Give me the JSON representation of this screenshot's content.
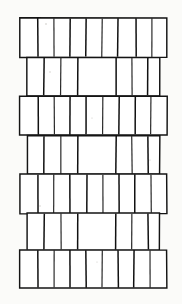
{
  "figure": {
    "medium": "black ink line drawing on off-white paper",
    "width_px": 182,
    "height_px": 304,
    "colors": {
      "ink": "#141414",
      "paper": "#fbfbf9",
      "brick_face": "#ffffff",
      "speck": "#c9c7c2"
    },
    "geometry": {
      "course_count": 7,
      "full_course_indices": [
        0,
        2,
        4,
        6
      ],
      "gap_course_indices": [
        1,
        3,
        5
      ],
      "wide_course_left_x": 20,
      "wide_course_right_x": 167,
      "narrow_course_left_x": 27,
      "narrow_course_right_x": 160,
      "course_tops": [
        18,
        57,
        96,
        135,
        174,
        213,
        250
      ],
      "course_bottoms": [
        57,
        96,
        135,
        174,
        213,
        250,
        288
      ],
      "stroke_width": 1.45
    },
    "courses": [
      {
        "index": 0,
        "name": "course-1",
        "type": "full",
        "top": 18,
        "bottom": 57,
        "left": 20,
        "right": 167,
        "joints": [
          38,
          54,
          70,
          86,
          102,
          118,
          136,
          152
        ]
      },
      {
        "index": 1,
        "name": "course-2",
        "type": "gapped",
        "top": 57,
        "bottom": 96,
        "left": 27,
        "right": 160,
        "joints": [
          44,
          61,
          78,
          116,
          132,
          148
        ]
      },
      {
        "index": 2,
        "name": "course-3",
        "type": "full",
        "top": 96,
        "bottom": 135,
        "left": 20,
        "right": 167,
        "joints": [
          38,
          54,
          70,
          86,
          103,
          119,
          135,
          151
        ]
      },
      {
        "index": 3,
        "name": "course-4",
        "type": "gapped",
        "top": 135,
        "bottom": 174,
        "left": 27,
        "right": 160,
        "joints": [
          44,
          61,
          78,
          116,
          132,
          148
        ]
      },
      {
        "index": 4,
        "name": "course-5",
        "type": "full",
        "top": 174,
        "bottom": 213,
        "left": 20,
        "right": 167,
        "joints": [
          38,
          54,
          70,
          87,
          103,
          119,
          135,
          151
        ]
      },
      {
        "index": 5,
        "name": "course-6",
        "type": "gapped",
        "top": 213,
        "bottom": 250,
        "left": 27,
        "right": 160,
        "joints": [
          44,
          61,
          78,
          116,
          132,
          148
        ]
      },
      {
        "index": 6,
        "name": "course-7",
        "type": "full",
        "top": 250,
        "bottom": 288,
        "left": 20,
        "right": 167,
        "joints": [
          38,
          54,
          70,
          86,
          102,
          118,
          134,
          150
        ]
      }
    ],
    "specks": [
      {
        "x": 46,
        "y": 24,
        "r": 0.8
      },
      {
        "x": 50,
        "y": 72,
        "r": 0.7
      },
      {
        "x": 92,
        "y": 118,
        "r": 0.6
      },
      {
        "x": 40,
        "y": 206,
        "r": 0.7
      },
      {
        "x": 97,
        "y": 262,
        "r": 0.6
      },
      {
        "x": 150,
        "y": 160,
        "r": 0.6
      }
    ]
  }
}
